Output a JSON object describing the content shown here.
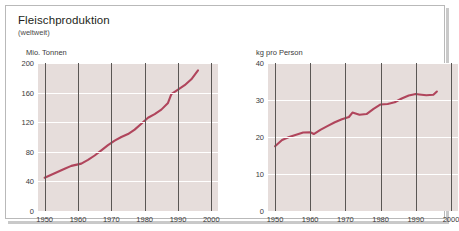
{
  "card": {
    "title": "Fleischproduktion",
    "subtitle": "(weltweit)"
  },
  "colors": {
    "line": "#b0455c",
    "plot_background": "#e6dddb",
    "grid_horizontal": "#ffffff",
    "grid_vertical": "#5a5654",
    "text": "#3a3a3a",
    "card_border": "#b9b9b9"
  },
  "chart_data": [
    {
      "type": "line",
      "id": "production-total",
      "title": "Fleischproduktion",
      "subtitle": "(weltweit)",
      "ylabel": "Mio. Tonnen",
      "xlabel": "",
      "ylim": [
        0,
        200
      ],
      "xlim": [
        1948,
        2002
      ],
      "yticks": [
        0,
        40,
        80,
        120,
        160,
        200
      ],
      "ytick_labels": [
        "0",
        "40",
        "80",
        "120",
        "160",
        "200"
      ],
      "xticks": [
        1950,
        1960,
        1970,
        1980,
        1990,
        2000
      ],
      "xtick_labels": [
        "1950",
        "1960",
        "1970",
        "1980",
        "1990",
        "2000"
      ],
      "grid": "horizontal-white-and-vertical-decade",
      "legend": "none",
      "series": [
        {
          "name": "Fleischproduktion weltweit",
          "unit": "Mio. Tonnen",
          "x": [
            1950,
            1952,
            1954,
            1956,
            1958,
            1960,
            1961,
            1963,
            1965,
            1967,
            1969,
            1971,
            1973,
            1975,
            1977,
            1979,
            1981,
            1983,
            1985,
            1987,
            1988,
            1990,
            1992,
            1994,
            1996
          ],
          "values": [
            45,
            49,
            53,
            57,
            61,
            63,
            64,
            69,
            75,
            82,
            89,
            95,
            100,
            104,
            110,
            118,
            126,
            131,
            137,
            146,
            158,
            164,
            170,
            178,
            190
          ]
        }
      ]
    },
    {
      "type": "line",
      "id": "production-per-capita",
      "title": "Fleischproduktion",
      "subtitle": "(weltweit)",
      "ylabel": "kg pro Person",
      "xlabel": "",
      "ylim": [
        0,
        40
      ],
      "xlim": [
        1948,
        2002
      ],
      "yticks": [
        0,
        10,
        20,
        30,
        40
      ],
      "ytick_labels": [
        "0",
        "10",
        "20",
        "30",
        "40"
      ],
      "xticks": [
        1950,
        1960,
        1970,
        1980,
        1990,
        2000
      ],
      "xtick_labels": [
        "1950",
        "1960",
        "1970",
        "1980",
        "1990",
        "2000"
      ],
      "grid": "horizontal-white-and-vertical-decade",
      "legend": "none",
      "series": [
        {
          "name": "Fleischproduktion pro Kopf",
          "unit": "kg pro Person",
          "x": [
            1950,
            1952,
            1954,
            1956,
            1958,
            1960,
            1961,
            1963,
            1965,
            1967,
            1969,
            1971,
            1972,
            1974,
            1976,
            1978,
            1980,
            1982,
            1984,
            1986,
            1988,
            1990,
            1991,
            1993,
            1995,
            1996
          ],
          "values": [
            17.5,
            19.2,
            20.0,
            20.6,
            21.2,
            21.3,
            20.8,
            22.0,
            23.0,
            24.0,
            24.8,
            25.4,
            26.6,
            26.0,
            26.2,
            27.6,
            28.8,
            28.9,
            29.4,
            30.4,
            31.2,
            31.6,
            31.5,
            31.3,
            31.4,
            32.3
          ]
        }
      ]
    }
  ]
}
